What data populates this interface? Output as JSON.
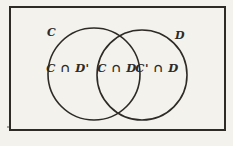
{
  "diagram": {
    "type": "venn",
    "colors": {
      "ink": "#2e2b27",
      "background": "#f3f2ed"
    },
    "set_labels": [
      {
        "text": "C"
      },
      {
        "text": "D"
      }
    ],
    "regions": [
      {
        "name": "left-only",
        "label": "C ∩ D'"
      },
      {
        "name": "intersection",
        "label": "C ∩ D"
      },
      {
        "name": "right-only",
        "label": "C' ∩ D"
      }
    ]
  }
}
